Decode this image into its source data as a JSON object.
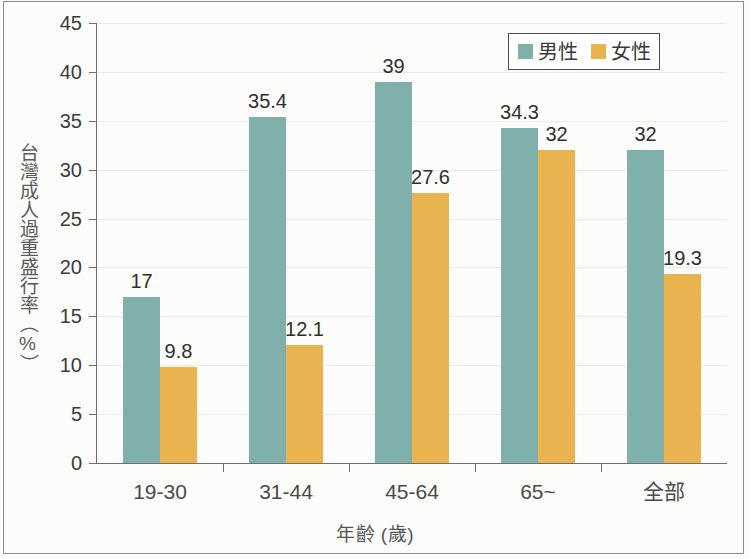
{
  "chart_data": {
    "type": "bar",
    "title": "",
    "xlabel": "年齡 (歲)",
    "ylabel": "台灣成人過重盛行率（%）",
    "categories": [
      "19-30",
      "31-44",
      "45-64",
      "65~",
      "全部"
    ],
    "series": [
      {
        "name": "男性",
        "color": "#7fb0ab",
        "values": [
          17,
          35.4,
          39,
          34.3,
          32
        ],
        "labels": [
          "17",
          "35.4",
          "39",
          "34.3",
          "32"
        ]
      },
      {
        "name": "女性",
        "color": "#e9b44f",
        "values": [
          9.8,
          12.1,
          27.6,
          32,
          19.3
        ],
        "labels": [
          "9.8",
          "12.1",
          "27.6",
          "32",
          "19.3"
        ]
      }
    ],
    "ylim": [
      0,
      45
    ],
    "yticks": [
      0,
      5,
      10,
      15,
      20,
      25,
      30,
      35,
      40,
      45
    ],
    "ytick_labels": [
      "0",
      "5",
      "10",
      "15",
      "20",
      "25",
      "30",
      "35",
      "40",
      "45"
    ],
    "grid": true,
    "legend_position": "top-right"
  },
  "axes": {
    "y_title": "台灣成人過重盛行率（%）",
    "x_title": "年齡 (歲)"
  },
  "legend": {
    "entries": [
      {
        "label": "男性",
        "color": "#7fb0ab"
      },
      {
        "label": "女性",
        "color": "#e9b44f"
      }
    ]
  },
  "colors": {
    "male": "#7fb0ab",
    "female": "#e9b44f",
    "axis": "#6e6e6e",
    "grid": "#e9eaea",
    "background": "#fcfcfa",
    "text": "#3b3b3b"
  }
}
